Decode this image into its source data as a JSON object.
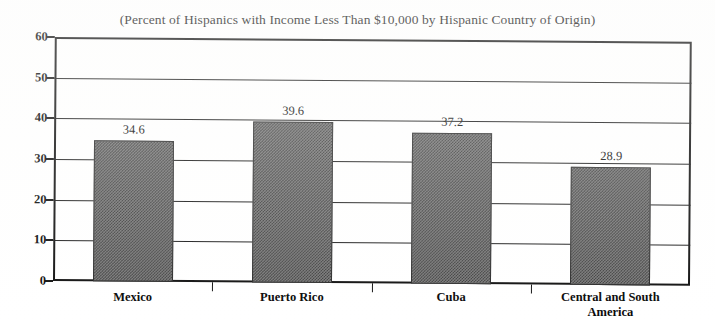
{
  "chart_data": {
    "type": "bar",
    "title": "(Percent of Hispanics with Income Less Than $10,000 by Hispanic Country of Origin)",
    "xlabel": "",
    "ylabel": "",
    "categories": [
      "Mexico",
      "Puerto Rico",
      "Cuba",
      "Central and South\nAmerica"
    ],
    "values": [
      34.6,
      39.6,
      37.2,
      28.9
    ],
    "value_labels": [
      "34.6",
      "39.6",
      "37.2",
      "28.9"
    ],
    "ylim": [
      0,
      60
    ],
    "ytick_values": [
      0,
      10,
      20,
      30,
      40,
      50,
      60
    ],
    "ytick_labels": [
      "0",
      "10",
      "20",
      "30",
      "40",
      "50",
      "60"
    ],
    "grid": "horizontal",
    "legend": "none",
    "bar_color": "#6e6e6e",
    "bar_edge_color": "#2a2a2a",
    "axis_color": "#101010",
    "background_color": "#ffffff"
  }
}
